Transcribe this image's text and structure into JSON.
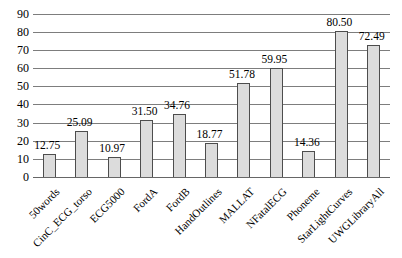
{
  "chart_data": {
    "type": "bar",
    "title": "",
    "xlabel": "",
    "ylabel": "",
    "categories": [
      "50words",
      "CinC_ECG_torso",
      "ECG5000",
      "FordA",
      "FordB",
      "HandOutlines",
      "MALLAT",
      "NFatalECG",
      "Phoneme",
      "StarLightCurves",
      "UWGLibraryAll"
    ],
    "values": [
      12.75,
      25.09,
      10.97,
      31.5,
      34.76,
      18.77,
      51.78,
      59.95,
      14.36,
      80.5,
      72.49
    ],
    "value_labels": [
      "12.75",
      "25.09",
      "10.97",
      "31.50",
      "34.76",
      "18.77",
      "51.78",
      "59.95",
      "14.36",
      "80.50",
      "72.49"
    ],
    "ylim": [
      0,
      90
    ],
    "ytick_step": 10,
    "ytick_labels": [
      "0",
      "10",
      "20",
      "30",
      "40",
      "50",
      "60",
      "70",
      "80",
      "90"
    ],
    "grid": "horizontal",
    "legend": "none",
    "colors": {
      "bar_fill": "#dcdcdc",
      "bar_border": "#4d4d4d",
      "gridline": "#7d7d7d",
      "axis_line": "#666666",
      "text": "#000000",
      "background": "#ffffff"
    }
  }
}
